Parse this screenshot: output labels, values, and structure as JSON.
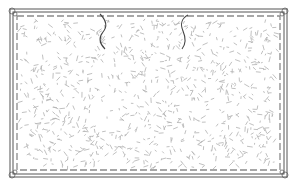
{
  "figure": {
    "colors": {
      "background": "#ffffff",
      "outline": "#555555",
      "stitch": "#8a8a8a",
      "texture": "#b0b0b0",
      "break_line": "#444444"
    }
  }
}
